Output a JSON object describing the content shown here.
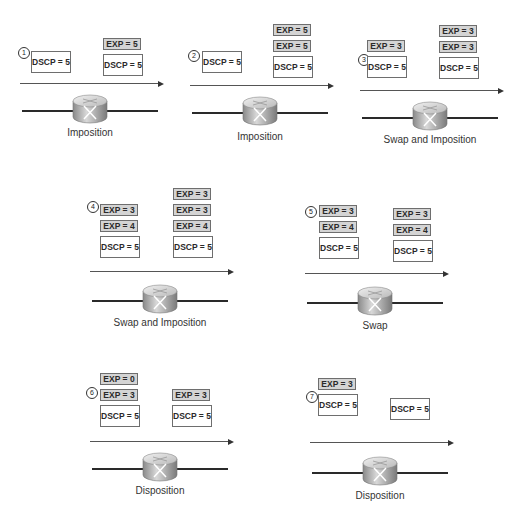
{
  "stages": [
    {
      "number": "1",
      "caption": "Imposition",
      "before": [
        "DSCP = 5"
      ],
      "after": [
        "EXP = 5",
        "DSCP = 5"
      ]
    },
    {
      "number": "2",
      "caption": "Imposition",
      "before": [
        "DSCP = 5"
      ],
      "after": [
        "EXP = 5",
        "EXP = 5",
        "DSCP = 5"
      ]
    },
    {
      "number": "3",
      "caption": "Swap and Imposition",
      "before": [
        "EXP = 3",
        "DSCP = 5"
      ],
      "after": [
        "EXP = 3",
        "EXP = 3",
        "DSCP = 5"
      ]
    },
    {
      "number": "4",
      "caption": "Swap and Imposition",
      "before": [
        "EXP = 3",
        "EXP = 4",
        "DSCP = 5"
      ],
      "after": [
        "EXP = 3",
        "EXP = 3",
        "EXP = 4",
        "DSCP = 5"
      ]
    },
    {
      "number": "5",
      "caption": "Swap",
      "before": [
        "EXP = 3",
        "EXP = 4",
        "DSCP = 5"
      ],
      "after": [
        "EXP = 3",
        "EXP = 4",
        "DSCP = 5"
      ]
    },
    {
      "number": "6",
      "caption": "Disposition",
      "before": [
        "EXP = 0",
        "EXP = 3",
        "DSCP = 5"
      ],
      "after": [
        "EXP = 3",
        "DSCP = 5"
      ]
    },
    {
      "number": "7",
      "caption": "Disposition",
      "before": [
        "EXP = 3",
        "DSCP = 5"
      ],
      "after": [
        "DSCP = 5"
      ]
    }
  ],
  "icons": {
    "router": "router-icon",
    "arrow": "arrow-right-icon"
  }
}
